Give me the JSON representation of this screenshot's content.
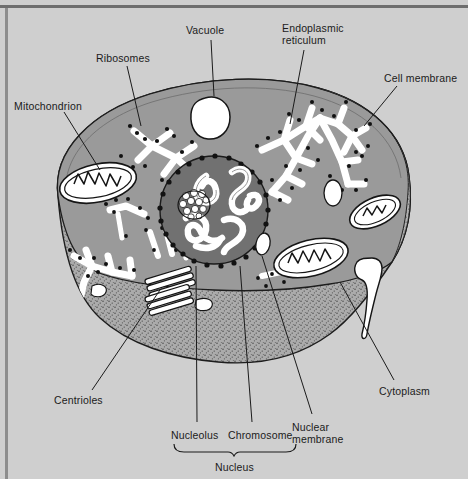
{
  "diagram": {
    "background_color": "#cfcfcf",
    "cytoplasm_color": "#999999",
    "cut_surface_color": "#a8a8a8",
    "nucleus_color": "#6f6f6f",
    "organelle_fill": "#ffffff",
    "outline_color": "#141414"
  },
  "labels": {
    "mitochondrion": "Mitochondrion",
    "ribosomes": "Ribosomes",
    "vacuole": "Vacuole",
    "endoplasmic_reticulum_line1": "Endoplasmic",
    "endoplasmic_reticulum_line2": "reticulum",
    "cell_membrane": "Cell membrane",
    "cytoplasm": "Cytoplasm",
    "centrioles": "Centrioles",
    "nucleolus": "Nucleolus",
    "chromosome": "Chromosome",
    "nuclear_membrane_line1": "Nuclear",
    "nuclear_membrane_line2": "membrane",
    "nucleus": "Nucleus"
  },
  "structure_counts": {
    "mitochondria": 3,
    "vacuoles": 3,
    "centriole_tubes": 6,
    "nucleoli": 1
  },
  "label_positions": {
    "mitochondrion": {
      "x": 14,
      "y": 100
    },
    "ribosomes": {
      "x": 96,
      "y": 52
    },
    "vacuole": {
      "x": 186,
      "y": 24
    },
    "endoplasmic_reticulum": {
      "x": 280,
      "y": 28
    },
    "cell_membrane": {
      "x": 385,
      "y": 72
    },
    "cytoplasm": {
      "x": 379,
      "y": 385
    },
    "centrioles": {
      "x": 55,
      "y": 394
    },
    "nucleolus": {
      "x": 172,
      "y": 429
    },
    "chromosome": {
      "x": 229,
      "y": 429
    },
    "nuclear_membrane": {
      "x": 293,
      "y": 422
    },
    "nucleus": {
      "x": 217,
      "y": 461
    }
  }
}
